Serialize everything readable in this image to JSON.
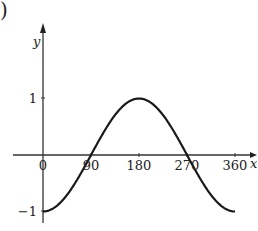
{
  "label_prefix": ")",
  "chart_data": {
    "type": "line",
    "title": "",
    "xlabel": "x",
    "ylabel": "y",
    "xticks": [
      "0",
      "90",
      "180",
      "270",
      "360"
    ],
    "yticks": [
      "1",
      "−1"
    ],
    "xlim": [
      0,
      360
    ],
    "ylim": [
      -1,
      1
    ],
    "grid": false,
    "legend": null,
    "series": [
      {
        "name": "y = -cos x",
        "x": [
          0,
          45,
          90,
          135,
          180,
          225,
          270,
          315,
          360
        ],
        "y": [
          -1,
          -0.707,
          0,
          0.707,
          1,
          0.707,
          0,
          -0.707,
          -1
        ]
      }
    ]
  }
}
